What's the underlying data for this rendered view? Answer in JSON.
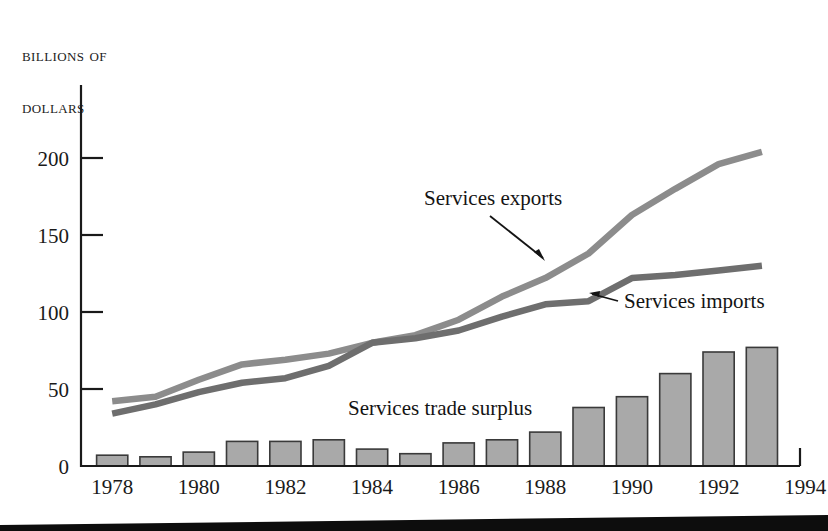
{
  "figure": {
    "axis_title_line1": "Billions of",
    "axis_title_line2": "dollars",
    "background_color": "#ffffff"
  },
  "colors": {
    "exports_line": "#8c8c8c",
    "imports_line": "#6e6e6e",
    "bar_fill": "#a9a9a9",
    "bar_stroke": "#3a3a3a",
    "axis": "#1a1a1a",
    "text": "#141414"
  },
  "annotations": {
    "exports_label": "Services exports",
    "imports_label": "Services imports",
    "bars_label": "Services trade surplus"
  },
  "chart_data": {
    "type": "line",
    "title": "",
    "subtitle": "",
    "xlabel": "",
    "ylabel": "Billions of dollars",
    "xlim": [
      1977.4,
      1994
    ],
    "ylim": [
      0,
      230
    ],
    "yticks": [
      0,
      50,
      100,
      150,
      200
    ],
    "xticks": [
      1978,
      1980,
      1982,
      1984,
      1986,
      1988,
      1990,
      1992,
      1994
    ],
    "grid": false,
    "legend": "annotated-inline",
    "x": [
      1978,
      1979,
      1980,
      1981,
      1982,
      1983,
      1984,
      1985,
      1986,
      1987,
      1988,
      1989,
      1990,
      1991,
      1992,
      1993
    ],
    "series": [
      {
        "name": "Services exports",
        "type": "line",
        "color": "#8c8c8c",
        "values": [
          42,
          45,
          56,
          66,
          69,
          73,
          80,
          85,
          95,
          110,
          122,
          138,
          163,
          180,
          196,
          204
        ]
      },
      {
        "name": "Services imports",
        "type": "line",
        "color": "#6e6e6e",
        "values": [
          34,
          40,
          48,
          54,
          57,
          65,
          80,
          83,
          88,
          97,
          105,
          107,
          122,
          124,
          127,
          130
        ]
      },
      {
        "name": "Services trade surplus",
        "type": "bar",
        "color": "#a9a9a9",
        "values": [
          7,
          6,
          9,
          16,
          16,
          17,
          11,
          8,
          15,
          17,
          22,
          38,
          45,
          60,
          74,
          77
        ]
      }
    ]
  }
}
